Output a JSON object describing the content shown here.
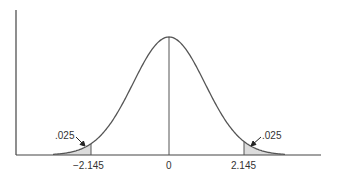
{
  "chart_data": {
    "type": "area",
    "title": "",
    "xlabel": "",
    "ylabel": "",
    "x_ticks": [
      "-2.145",
      "0",
      "2.145"
    ],
    "center": 0,
    "critical_values": [
      -2.145,
      2.145
    ],
    "tail_areas": [
      {
        "side": "left",
        "boundary": -2.145,
        "area": ".025",
        "shaded": true
      },
      {
        "side": "right",
        "boundary": 2.145,
        "area": ".025",
        "shaded": true
      }
    ],
    "center_line_at": 0,
    "grid": false,
    "legend": null
  },
  "labels": {
    "left_tick": "−2.145",
    "center_tick": "0",
    "right_tick": "2.145",
    "left_area": ".025",
    "right_area": ".025"
  },
  "colors": {
    "curve": "#555555",
    "shade": "#dcdcdc",
    "axis": "#444444"
  }
}
